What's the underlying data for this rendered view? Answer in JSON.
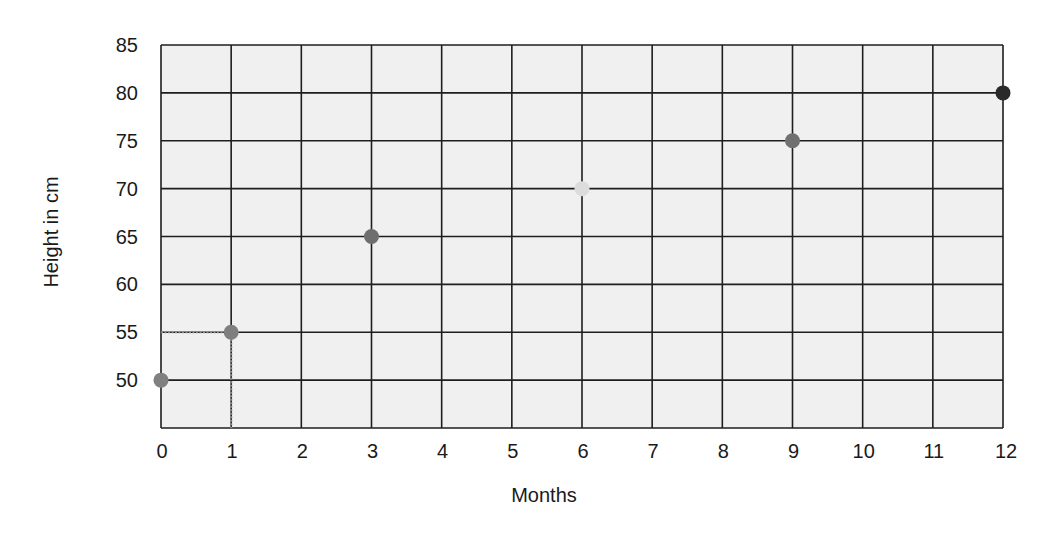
{
  "chart_data": {
    "type": "scatter",
    "title": "",
    "xlabel": "Months",
    "ylabel": "Height in cm",
    "x_ticks": [
      0,
      1,
      2,
      3,
      4,
      5,
      6,
      7,
      8,
      9,
      10,
      11,
      12
    ],
    "y_ticks": [
      50,
      55,
      60,
      65,
      70,
      75,
      80,
      85
    ],
    "xlim": [
      0,
      12
    ],
    "ylim": [
      45,
      85
    ],
    "grid": true,
    "legend": null,
    "series": [
      {
        "name": "Height",
        "points": [
          {
            "x": 0,
            "y": 50,
            "color": "#808080"
          },
          {
            "x": 1,
            "y": 55,
            "color": "#7f7f7f"
          },
          {
            "x": 3,
            "y": 65,
            "color": "#6e6e6e"
          },
          {
            "x": 6,
            "y": 70,
            "color": "#dcdcdc"
          },
          {
            "x": 9,
            "y": 75,
            "color": "#707070"
          },
          {
            "x": 12,
            "y": 80,
            "color": "#2a2a2a"
          }
        ]
      }
    ],
    "annotations": [
      {
        "type": "dotted-guide",
        "from": {
          "x": 0,
          "y": 55
        },
        "to": {
          "x": 1,
          "y": 55
        }
      },
      {
        "type": "dotted-guide",
        "from": {
          "x": 1,
          "y": 55
        },
        "to": {
          "x": 1,
          "y": 45
        }
      }
    ]
  },
  "colors": {
    "plot_background": "#f0f0f0",
    "grid_line": "#1e1e1e",
    "guide_line": "#8a8a8a",
    "text": "#1a1a1a"
  }
}
